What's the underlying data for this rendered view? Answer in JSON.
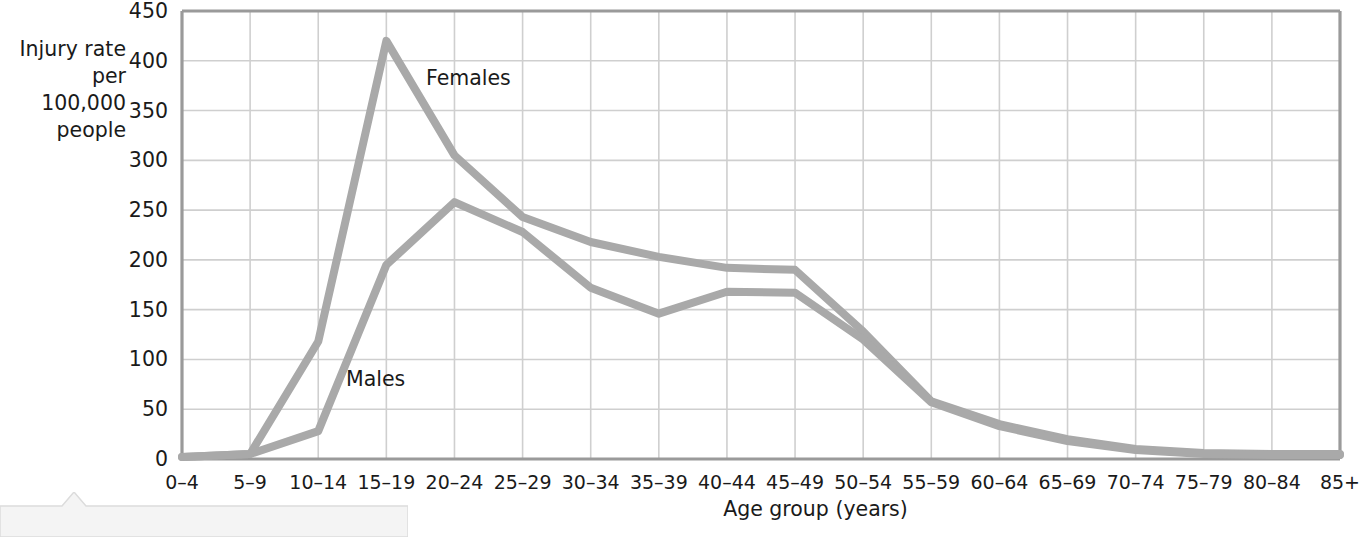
{
  "axes": {
    "y_label": "Injury rate\nper 100,000\npeople",
    "x_label": "Age group (years)"
  },
  "series_labels": {
    "females": "Females",
    "males": "Males"
  },
  "colors": {
    "line": "#a9a9a9",
    "gridline": "#cfcfcf",
    "axis": "#9a9a9a",
    "text": "#1a1a1a"
  },
  "chart_data": {
    "type": "line",
    "title": "",
    "xlabel": "Age group (years)",
    "ylabel": "Injury rate per 100,000 people",
    "ylim": [
      0,
      450
    ],
    "yticks": [
      0,
      50,
      100,
      150,
      200,
      250,
      300,
      350,
      400,
      450
    ],
    "grid": true,
    "legend_position": "inline-annotation",
    "categories": [
      "0–4",
      "5–9",
      "10–14",
      "15–19",
      "20–24",
      "25–29",
      "30–34",
      "35–39",
      "40–44",
      "45–49",
      "50–54",
      "55–59",
      "60–64",
      "65–69",
      "70–74",
      "75–79",
      "80–84",
      "85+"
    ],
    "series": [
      {
        "name": "Females",
        "values": [
          2,
          5,
          118,
          420,
          305,
          243,
          218,
          203,
          192,
          190,
          128,
          58,
          35,
          20,
          10,
          6,
          5,
          5
        ]
      },
      {
        "name": "Males",
        "values": [
          2,
          5,
          28,
          195,
          258,
          228,
          172,
          146,
          168,
          167,
          120,
          57,
          33,
          18,
          9,
          5,
          4,
          4
        ]
      }
    ]
  }
}
